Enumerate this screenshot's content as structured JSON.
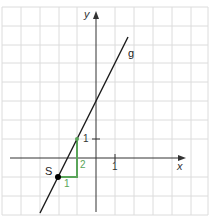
{
  "figure": {
    "type": "coordinate-graph",
    "origin_px": [
      96,
      158
    ],
    "unit_px": 19,
    "grid": {
      "color": "#dcdcdc",
      "x_lines_px": [
        2,
        21,
        40,
        59,
        77,
        96,
        115,
        134,
        153,
        172,
        191,
        208
      ],
      "y_lines_px": [
        7,
        26,
        45,
        63,
        82,
        101,
        120,
        139,
        158,
        177,
        196,
        215
      ]
    },
    "axes": {
      "x_label": "x",
      "y_label": "y",
      "x_tick_label": "1",
      "y_tick_label": "1",
      "color": "#333333"
    },
    "line": {
      "name": "g",
      "equation": "y = 2x + 3",
      "slope": 2,
      "intercept": 3,
      "color": "#1a1a1a"
    },
    "point": {
      "label": "S",
      "coords": [
        -2,
        -1
      ]
    },
    "slope_triangle": {
      "run_label": "1",
      "rise_label": "2",
      "color": "#5aa55a",
      "from": [
        -2,
        -1
      ],
      "corner": [
        -1,
        -1
      ],
      "to": [
        -1,
        1
      ]
    }
  }
}
